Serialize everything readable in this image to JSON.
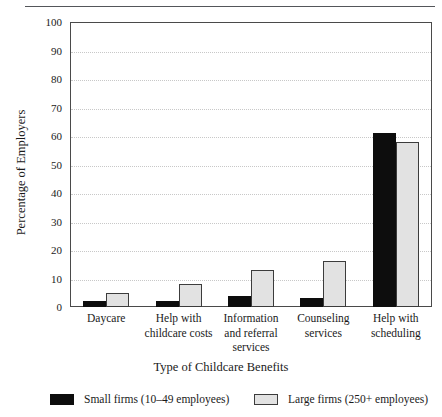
{
  "chart_data": {
    "type": "bar",
    "title": "",
    "xlabel": "Type of Childcare Benefits",
    "ylabel": "Percentage of Employers",
    "ylim": [
      0,
      100
    ],
    "ytick_step": 10,
    "yticks": [
      "100",
      "90",
      "80",
      "70",
      "60",
      "50",
      "40",
      "30",
      "20",
      "10",
      "0"
    ],
    "grid": true,
    "legend_position": "bottom",
    "categories": [
      "Daycare",
      "Help with childcare costs",
      "Information and referral services",
      "Counseling services",
      "Help with scheduling"
    ],
    "category_lines": [
      [
        "Daycare"
      ],
      [
        "Help with",
        "childcare costs"
      ],
      [
        "Information",
        "and referral",
        "services"
      ],
      [
        "Counseling",
        "services"
      ],
      [
        "Help with",
        "scheduling"
      ]
    ],
    "series": [
      {
        "name": "Small firms (10–49 employees)",
        "color": "#0d0d0d",
        "values": [
          2,
          2,
          4,
          3,
          61
        ]
      },
      {
        "name": "Large firms (250+ employees)",
        "color": "#e2e2e2",
        "values": [
          5,
          8,
          13,
          16,
          58
        ]
      }
    ]
  },
  "legend": {
    "items": [
      {
        "label": "Small firms (10–49 employees)",
        "swatch": "black"
      },
      {
        "label": "Large firms (250+ employees)",
        "swatch": "grey"
      }
    ]
  }
}
